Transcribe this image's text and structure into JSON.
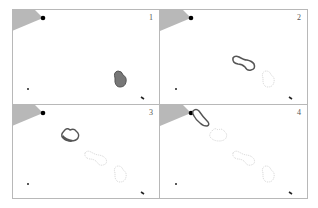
{
  "figure": {
    "panels": [
      {
        "label": "1"
      },
      {
        "label": "2"
      },
      {
        "label": "3"
      },
      {
        "label": "4"
      }
    ],
    "colors": {
      "sector": "#b8b8b8",
      "source": "#000000",
      "blob_current": "#6a6a6a",
      "blob_past_outline": "#c8c8c8",
      "border": "#b8b8b8"
    }
  }
}
